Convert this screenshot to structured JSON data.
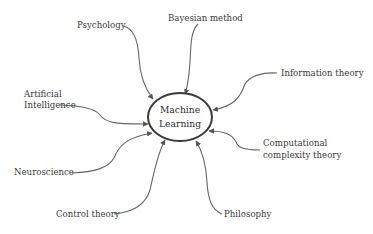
{
  "diagram": {
    "title": "",
    "center": {
      "line1": "Machine",
      "line2": "Learning"
    },
    "nodes": [
      {
        "id": "psychology",
        "lines": [
          "Psychology"
        ]
      },
      {
        "id": "bayesian",
        "lines": [
          "Bayesian method"
        ]
      },
      {
        "id": "information-theory",
        "lines": [
          "Information theory"
        ]
      },
      {
        "id": "artificial-intelligence",
        "lines": [
          "Artificial",
          "Intelligence"
        ]
      },
      {
        "id": "computational-complexity",
        "lines": [
          "Computational",
          "complexity theory"
        ]
      },
      {
        "id": "neuroscience",
        "lines": [
          "Neuroscience"
        ]
      },
      {
        "id": "control-theory",
        "lines": [
          "Control theory"
        ]
      },
      {
        "id": "philosophy",
        "lines": [
          "Philosophy"
        ]
      }
    ],
    "edges": [
      {
        "from": "psychology",
        "to": "center"
      },
      {
        "from": "bayesian",
        "to": "center"
      },
      {
        "from": "information-theory",
        "to": "center"
      },
      {
        "from": "artificial-intelligence",
        "to": "center"
      },
      {
        "from": "computational-complexity",
        "to": "center"
      },
      {
        "from": "neuroscience",
        "to": "center"
      },
      {
        "from": "control-theory",
        "to": "center"
      },
      {
        "from": "philosophy",
        "to": "center"
      }
    ],
    "colors": {
      "text": "#3a3a3a",
      "edge": "#666666",
      "ellipse_stroke": "#3a3a3a"
    }
  }
}
